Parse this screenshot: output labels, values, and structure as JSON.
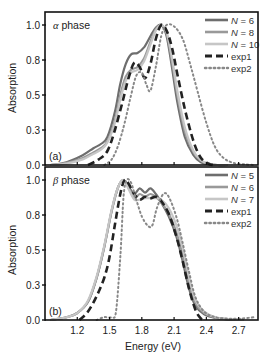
{
  "chart_data": [
    {
      "type": "line",
      "panel_tag": "(a)",
      "title": "α phase",
      "title_greek": "α",
      "title_rest": " phase",
      "xlabel": "",
      "ylabel": "Absorption",
      "xlim": [
        0.9,
        2.88
      ],
      "ylim": [
        0.0,
        1.05
      ],
      "yticks": [
        0.0,
        0.25,
        0.5,
        0.75,
        1.0
      ],
      "ytick_labels": [
        "0.0",
        "0.3",
        "0.5",
        "0.8",
        "1.0"
      ],
      "xticks": [
        1.2,
        1.5,
        1.8,
        2.1,
        2.4,
        2.7
      ],
      "xtick_labels": [],
      "legend_position": "top-right",
      "series": [
        {
          "name": "N = 6",
          "legend_var": "N",
          "legend_val": " = 6",
          "style": "solid",
          "color": "#6e6e6e",
          "x": [
            0.95,
            1.1,
            1.25,
            1.35,
            1.42,
            1.48,
            1.55,
            1.6,
            1.65,
            1.7,
            1.76,
            1.82,
            1.88,
            1.93,
            1.98,
            2.03,
            2.08,
            2.13,
            2.2,
            2.28,
            2.35,
            2.42,
            2.5,
            2.6
          ],
          "y": [
            0.0,
            0.02,
            0.07,
            0.12,
            0.15,
            0.2,
            0.38,
            0.58,
            0.72,
            0.79,
            0.8,
            0.84,
            0.92,
            0.98,
            1.0,
            0.92,
            0.7,
            0.45,
            0.2,
            0.07,
            0.02,
            0.005,
            0.0,
            0.0
          ]
        },
        {
          "name": "N = 8",
          "legend_var": "N",
          "legend_val": " = 8",
          "style": "solid",
          "color": "#999999",
          "x": [
            0.95,
            1.1,
            1.25,
            1.35,
            1.42,
            1.48,
            1.55,
            1.6,
            1.65,
            1.7,
            1.76,
            1.82,
            1.88,
            1.93,
            1.98,
            2.03,
            2.08,
            2.13,
            2.2,
            2.28,
            2.35,
            2.42,
            2.5,
            2.6
          ],
          "y": [
            0.0,
            0.015,
            0.05,
            0.09,
            0.12,
            0.17,
            0.32,
            0.5,
            0.63,
            0.68,
            0.7,
            0.76,
            0.88,
            0.97,
            1.0,
            0.94,
            0.74,
            0.5,
            0.24,
            0.09,
            0.03,
            0.008,
            0.0,
            0.0
          ]
        },
        {
          "name": "N = 10",
          "legend_var": "N",
          "legend_val": " = 10",
          "style": "solid",
          "color": "#c6c6c6",
          "x": [
            0.95,
            1.1,
            1.25,
            1.35,
            1.42,
            1.48,
            1.55,
            1.6,
            1.65,
            1.7,
            1.76,
            1.82,
            1.88,
            1.93,
            1.98,
            2.03,
            2.08,
            2.13,
            2.2,
            2.28,
            2.35,
            2.42,
            2.5,
            2.6
          ],
          "y": [
            0.0,
            0.01,
            0.04,
            0.08,
            0.11,
            0.16,
            0.3,
            0.47,
            0.6,
            0.66,
            0.68,
            0.74,
            0.86,
            0.96,
            1.0,
            0.95,
            0.77,
            0.53,
            0.27,
            0.1,
            0.035,
            0.01,
            0.0,
            0.0
          ]
        },
        {
          "name": "exp1",
          "legend_var": "",
          "legend_val": "exp1",
          "style": "dashed",
          "color": "#222222",
          "x": [
            1.3,
            1.4,
            1.48,
            1.55,
            1.62,
            1.68,
            1.73,
            1.78,
            1.83,
            1.88,
            1.93,
            1.98,
            2.03,
            2.08,
            2.13,
            2.2,
            2.28,
            2.35,
            2.42,
            2.46
          ],
          "y": [
            0.0,
            0.04,
            0.1,
            0.25,
            0.45,
            0.63,
            0.73,
            0.7,
            0.62,
            0.72,
            0.9,
            1.0,
            0.96,
            0.84,
            0.65,
            0.4,
            0.17,
            0.05,
            0.01,
            0.0
          ]
        },
        {
          "name": "exp2",
          "legend_var": "",
          "legend_val": "exp2",
          "style": "dotted",
          "color": "#888888",
          "x": [
            1.45,
            1.52,
            1.58,
            1.64,
            1.7,
            1.75,
            1.8,
            1.84,
            1.88,
            1.93,
            1.98,
            2.03,
            2.1,
            2.18,
            2.25,
            2.32,
            2.4,
            2.48,
            2.56,
            2.65,
            2.75,
            2.85
          ],
          "y": [
            0.0,
            0.04,
            0.14,
            0.3,
            0.5,
            0.64,
            0.66,
            0.58,
            0.53,
            0.7,
            0.92,
            1.0,
            0.99,
            0.9,
            0.72,
            0.52,
            0.3,
            0.13,
            0.05,
            0.015,
            0.005,
            0.0
          ]
        }
      ]
    },
    {
      "type": "line",
      "panel_tag": "(b)",
      "title": "β phase",
      "title_greek": "β",
      "title_rest": " phase",
      "xlabel": "Energy (eV)",
      "ylabel": "Absorption",
      "xlim": [
        0.9,
        2.88
      ],
      "ylim": [
        0.0,
        1.05
      ],
      "yticks": [
        0.0,
        0.25,
        0.5,
        0.75,
        1.0
      ],
      "ytick_labels": [
        "0.0",
        "0.3",
        "0.5",
        "0.8",
        "1.0"
      ],
      "xticks": [
        1.2,
        1.5,
        1.8,
        2.1,
        2.4,
        2.7
      ],
      "xtick_labels": [
        "1.2",
        "1.5",
        "1.8",
        "2.1",
        "2.4",
        "2.7"
      ],
      "legend_position": "top-right",
      "series": [
        {
          "name": "N = 5",
          "legend_var": "N",
          "legend_val": " = 5",
          "style": "solid",
          "color": "#6e6e6e",
          "x": [
            0.95,
            1.1,
            1.2,
            1.3,
            1.38,
            1.45,
            1.52,
            1.58,
            1.63,
            1.68,
            1.73,
            1.78,
            1.83,
            1.88,
            1.93,
            1.98,
            2.05,
            2.12,
            2.18,
            2.24,
            2.3,
            2.38,
            2.48,
            2.6,
            2.75
          ],
          "y": [
            0.0,
            0.02,
            0.05,
            0.13,
            0.3,
            0.52,
            0.78,
            0.95,
            1.0,
            0.95,
            0.9,
            0.94,
            0.91,
            0.94,
            0.9,
            0.84,
            0.74,
            0.6,
            0.42,
            0.22,
            0.1,
            0.04,
            0.015,
            0.005,
            0.0
          ]
        },
        {
          "name": "N = 6",
          "legend_var": "N",
          "legend_val": " = 6",
          "style": "solid",
          "color": "#999999",
          "x": [
            0.95,
            1.1,
            1.2,
            1.3,
            1.38,
            1.45,
            1.52,
            1.58,
            1.63,
            1.68,
            1.73,
            1.78,
            1.83,
            1.88,
            1.93,
            1.98,
            2.05,
            2.12,
            2.18,
            2.24,
            2.3,
            2.38,
            2.48,
            2.6,
            2.75
          ],
          "y": [
            0.0,
            0.02,
            0.05,
            0.13,
            0.3,
            0.52,
            0.78,
            0.95,
            1.0,
            0.94,
            0.87,
            0.9,
            0.88,
            0.9,
            0.88,
            0.84,
            0.76,
            0.63,
            0.46,
            0.26,
            0.12,
            0.05,
            0.02,
            0.005,
            0.0
          ]
        },
        {
          "name": "N = 7",
          "legend_var": "N",
          "legend_val": " = 7",
          "style": "solid",
          "color": "#c6c6c6",
          "x": [
            0.95,
            1.1,
            1.2,
            1.3,
            1.38,
            1.45,
            1.52,
            1.58,
            1.63,
            1.68,
            1.73,
            1.78,
            1.83,
            1.88,
            1.93,
            1.98,
            2.05,
            2.12,
            2.18,
            2.24,
            2.3,
            2.38,
            2.48,
            2.6,
            2.75
          ],
          "y": [
            0.0,
            0.02,
            0.05,
            0.14,
            0.31,
            0.53,
            0.79,
            0.95,
            1.0,
            0.93,
            0.86,
            0.86,
            0.87,
            0.87,
            0.87,
            0.86,
            0.8,
            0.68,
            0.52,
            0.3,
            0.14,
            0.06,
            0.02,
            0.006,
            0.0
          ]
        },
        {
          "name": "exp1",
          "legend_var": "",
          "legend_val": "exp1",
          "style": "dashed",
          "color": "#222222",
          "x": [
            1.22,
            1.3,
            1.38,
            1.45,
            1.5,
            1.55,
            1.6,
            1.64,
            1.68,
            1.73,
            1.78,
            1.83,
            1.88,
            1.93,
            1.98,
            2.05,
            2.12,
            2.18,
            2.24,
            2.3,
            2.35,
            2.38
          ],
          "y": [
            0.0,
            0.06,
            0.17,
            0.3,
            0.45,
            0.68,
            0.9,
            1.0,
            0.97,
            0.9,
            0.86,
            0.88,
            0.87,
            0.88,
            0.85,
            0.76,
            0.6,
            0.42,
            0.22,
            0.07,
            0.01,
            0.0
          ]
        },
        {
          "name": "exp2",
          "legend_var": "",
          "legend_val": "exp2",
          "style": "dotted",
          "color": "#888888",
          "x": [
            1.38,
            1.45,
            1.52,
            1.56,
            1.6,
            1.63,
            1.66,
            1.7,
            1.74,
            1.8,
            1.86,
            1.9,
            1.94,
            2.0,
            2.05,
            2.12,
            2.18,
            2.24,
            2.3,
            2.38,
            2.48,
            2.6,
            2.72,
            2.85
          ],
          "y": [
            0.0,
            0.02,
            0.02,
            0.06,
            0.45,
            0.88,
            1.0,
            0.98,
            0.88,
            0.74,
            0.67,
            0.68,
            0.8,
            0.9,
            0.88,
            0.74,
            0.55,
            0.34,
            0.16,
            0.06,
            0.02,
            0.01,
            0.01,
            0.02
          ]
        }
      ]
    }
  ]
}
